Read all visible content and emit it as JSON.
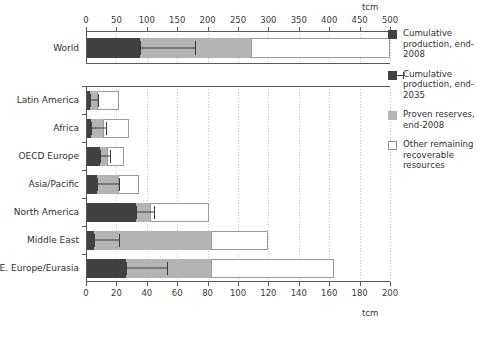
{
  "units": {
    "top": "tcm",
    "bottom": "tcm"
  },
  "legend": {
    "items": [
      {
        "key": "cumulative-production-2008",
        "label": "Cumulative production, end-2008",
        "swatch": "solid-dark",
        "color": "#414141"
      },
      {
        "key": "cumulative-production-2035",
        "label": "Cumulative production, end-2035",
        "swatch": "solid-dark-with-errorbar",
        "color": "#414141"
      },
      {
        "key": "proven-reserves-2008",
        "label": "Proven reserves, end-2008",
        "swatch": "solid-gray",
        "color": "#b4b4b4"
      },
      {
        "key": "other-remaining-recoverable-resources",
        "label": "Other remaining recoverable resources",
        "swatch": "outline-white",
        "color": "#ffffff"
      }
    ]
  },
  "chart_data": [
    {
      "id": "world-chart",
      "type": "bar",
      "orientation": "horizontal",
      "stacked": true,
      "title": "",
      "xlabel": "tcm",
      "ylabel": "",
      "xlim": [
        0,
        500
      ],
      "xticks": [
        0,
        50,
        100,
        150,
        200,
        250,
        300,
        350,
        400,
        450,
        500
      ],
      "xticklabels": [
        "0",
        "50",
        "100",
        "150",
        "200",
        "250",
        "300",
        "350",
        "400",
        "450",
        "500"
      ],
      "grid": true,
      "legend_position": "right",
      "categories": [
        "World"
      ],
      "series": [
        {
          "name": "Cumulative production, end-2008",
          "values": [
            88
          ]
        },
        {
          "name": "Proven reserves, end-2008",
          "values": [
            184
          ]
        },
        {
          "name": "Other remaining recoverable resources",
          "values": [
            228
          ]
        }
      ],
      "cumulative_totals": [
        {
          "category": "World",
          "production_2008": 88,
          "reserves_end": 272,
          "total": 500
        }
      ],
      "errorbars": [
        {
          "category": "World",
          "marker_name": "Cumulative production, end-2035",
          "start": 88,
          "end": 180
        }
      ]
    },
    {
      "id": "regions-chart",
      "type": "bar",
      "orientation": "horizontal",
      "stacked": true,
      "title": "",
      "xlabel": "tcm",
      "ylabel": "",
      "xlim": [
        0,
        200
      ],
      "xticks": [
        0,
        20,
        40,
        60,
        80,
        100,
        120,
        140,
        160,
        180,
        200
      ],
      "xticklabels": [
        "0",
        "20",
        "40",
        "60",
        "80",
        "100",
        "120",
        "140",
        "160",
        "180",
        "200"
      ],
      "grid": true,
      "legend_position": "right",
      "categories": [
        "Latin America",
        "Africa",
        "OECD Europe",
        "Asia/Pacific",
        "North America",
        "Middle East",
        "E. Europe/Eurasia"
      ],
      "series": [
        {
          "name": "Cumulative production, end-2008",
          "values": [
            2.5,
            3.5,
            9,
            7,
            33,
            5,
            26
          ]
        },
        {
          "name": "Proven reserves, end-2008",
          "values": [
            4.5,
            7.5,
            5,
            14,
            9,
            77,
            56
          ]
        },
        {
          "name": "Other remaining recoverable resources",
          "values": [
            15,
            17,
            11,
            14,
            39,
            38,
            81
          ]
        }
      ],
      "cumulative_totals": [
        {
          "category": "Latin America",
          "production_2008": 2.5,
          "reserves_end": 7,
          "total": 22
        },
        {
          "category": "Africa",
          "production_2008": 3.5,
          "reserves_end": 11,
          "total": 28
        },
        {
          "category": "OECD Europe",
          "production_2008": 9,
          "reserves_end": 14,
          "total": 25
        },
        {
          "category": "Asia/Pacific",
          "production_2008": 7,
          "reserves_end": 21,
          "total": 35
        },
        {
          "category": "North America",
          "production_2008": 33,
          "reserves_end": 42,
          "total": 81
        },
        {
          "category": "Middle East",
          "production_2008": 5,
          "reserves_end": 82,
          "total": 120
        },
        {
          "category": "E. Europe/Eurasia",
          "production_2008": 26,
          "reserves_end": 82,
          "total": 163
        }
      ],
      "errorbars": [
        {
          "category": "Latin America",
          "marker_name": "Cumulative production, end-2035",
          "start": 2.5,
          "end": 8
        },
        {
          "category": "Africa",
          "marker_name": "Cumulative production, end-2035",
          "start": 3.5,
          "end": 13
        },
        {
          "category": "OECD Europe",
          "marker_name": "Cumulative production, end-2035",
          "start": 9,
          "end": 16
        },
        {
          "category": "Asia/Pacific",
          "marker_name": "Cumulative production, end-2035",
          "start": 7,
          "end": 22
        },
        {
          "category": "North America",
          "marker_name": "Cumulative production, end-2035",
          "start": 33,
          "end": 45
        },
        {
          "category": "Middle East",
          "marker_name": "Cumulative production, end-2035",
          "start": 5,
          "end": 22
        },
        {
          "category": "E. Europe/Eurasia",
          "marker_name": "Cumulative production, end-2035",
          "start": 26,
          "end": 53
        }
      ]
    }
  ]
}
